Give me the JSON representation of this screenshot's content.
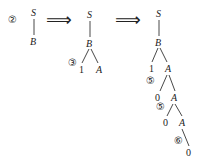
{
  "diagram": {
    "step_arrow": "⟹",
    "trees": [
      {
        "step_marker": "②",
        "nodes": {
          "root": "S",
          "child": "B"
        }
      },
      {
        "nodes": {
          "root": "S",
          "b": "B",
          "b_left": "1",
          "b_right": "A"
        },
        "markers": {
          "b_expand": "③"
        }
      },
      {
        "nodes": {
          "root": "S",
          "b": "B",
          "b_left": "1",
          "a1": "A",
          "a1_left": "0",
          "a2": "A",
          "a2_left": "0",
          "a3": "A",
          "a3_child": "0"
        },
        "markers": {
          "a1_expand": "⑤",
          "a2_expand": "⑤",
          "a3_expand": "⑥"
        }
      }
    ]
  }
}
